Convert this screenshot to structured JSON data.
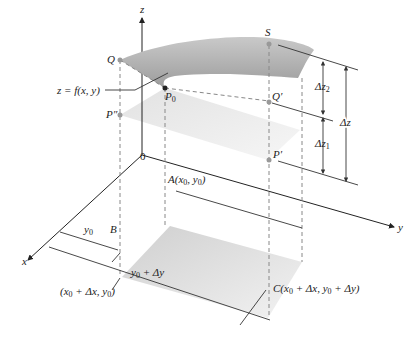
{
  "axes": {
    "x_label": "x",
    "y_label": "y",
    "z_label": "z",
    "origin_label": "0"
  },
  "points": {
    "Q": "Q",
    "S": "S",
    "P0": "P",
    "P0_sub": "0",
    "Q_prime": "Q′",
    "P_double_prime": "P″",
    "P_prime": "P′",
    "B": "B",
    "A": "A(x",
    "A_sub": "0",
    "A_rest": ", y",
    "A_sub2": "0",
    "A_close": ")"
  },
  "labels": {
    "surface": "z = f(x, y)",
    "y0": "y",
    "y0_sub": "0",
    "y0_dy": "y",
    "y0_dy_sub": "0",
    "y0_dy_rest": " + Δy",
    "B_coord": "(x",
    "B_coord_sub": "0",
    "B_coord_rest": " + Δx, y",
    "B_coord_sub2": "0",
    "B_coord_close": ")",
    "C_coord": "C(x",
    "C_coord_sub": "0",
    "C_coord_mid": " + Δx, y",
    "C_coord_sub2": "0",
    "C_coord_rest": " + Δy)",
    "dz2": "Δz",
    "dz2_sub": "2",
    "dz1": "Δz",
    "dz1_sub": "1",
    "dz": "Δz"
  },
  "colors": {
    "surface": "#a8a8a8",
    "plane": "#e4e4e4",
    "base": "#d4d4d4",
    "point": "#999999",
    "line": "#333333",
    "dash": "#888888"
  }
}
